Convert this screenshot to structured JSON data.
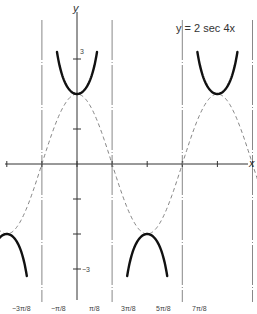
{
  "chart_data": {
    "type": "line",
    "title": "y = 2 sec 4x",
    "xlabel": "x",
    "ylabel": "y",
    "x_tick_labels": [
      "-3π/8",
      "-π/8",
      "π/8",
      "3π/8",
      "5π/8",
      "7π/8"
    ],
    "y_tick_labels": [
      "3",
      "-3"
    ],
    "asymptotes_x": [
      "-3π/8",
      "-π/8",
      "π/8",
      "3π/8",
      "5π/8",
      "7π/8"
    ],
    "series": [
      {
        "name": "y = 2 sec 4x",
        "style": "solid-bold",
        "description": "secant branches; minima at y=2 for x=0, π/2; maxima at y=-2 for x=-π/4, π/4, 3π/4"
      },
      {
        "name": "y = 2 cos 4x",
        "style": "dashed",
        "description": "reference cosine curve, amplitude 2, period π/2"
      }
    ],
    "xlim": [
      "-7π/16",
      "15π/16"
    ],
    "ylim": [
      -4.3,
      4.5
    ],
    "grid": false,
    "legend": "none"
  },
  "labels": {
    "title": "y = 2 sec 4x",
    "x_axis": "x",
    "y_axis": "y",
    "y_tick_pos": "3",
    "y_tick_neg": "−3",
    "x_ticks": [
      "−3π/8",
      "−π/8",
      "π/8",
      "3π/8",
      "5π/8",
      "7π/8"
    ]
  }
}
